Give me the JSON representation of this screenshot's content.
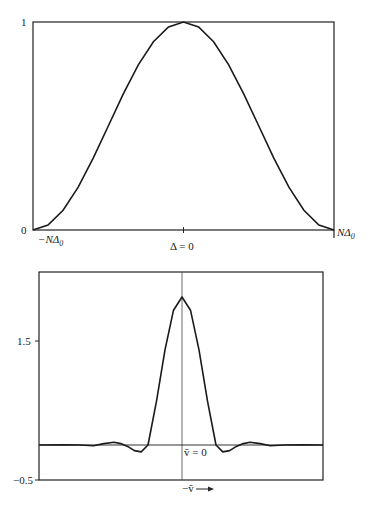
{
  "page": {
    "top_fragment": ""
  },
  "chart_data": [
    {
      "type": "line",
      "title": "",
      "xlabel": "",
      "ylabel": "",
      "x_tick_labels": [
        "−NΔ0",
        "Δ = 0",
        "NΔ0"
      ],
      "y_tick_labels": [
        "0",
        "1"
      ],
      "xlim": [
        -1,
        1
      ],
      "ylim": [
        0,
        1
      ],
      "grid": false,
      "legend": null,
      "x_units": "NΔ0",
      "series": [
        {
          "name": "window",
          "x": [
            -1.0,
            -0.9,
            -0.8,
            -0.7,
            -0.6,
            -0.5,
            -0.4,
            -0.3,
            -0.2,
            -0.1,
            0.0,
            0.1,
            0.2,
            0.3,
            0.4,
            0.5,
            0.6,
            0.7,
            0.8,
            0.9,
            1.0
          ],
          "y": [
            0.0,
            0.024,
            0.095,
            0.206,
            0.345,
            0.5,
            0.655,
            0.794,
            0.905,
            0.976,
            1.0,
            0.976,
            0.905,
            0.794,
            0.655,
            0.5,
            0.345,
            0.206,
            0.095,
            0.024,
            0.0
          ]
        }
      ]
    },
    {
      "type": "line",
      "title": "",
      "xlabel": "−v̄ ⟶",
      "ylabel": "",
      "x_tick_labels": [
        "v̄ = 0"
      ],
      "y_tick_labels": [
        "1.5",
        "−0.5"
      ],
      "y_ticks": [
        1.5,
        -0.5
      ],
      "xlim": [
        -4.2,
        4.15
      ],
      "ylim": [
        -0.5,
        2.49
      ],
      "grid": false,
      "legend": null,
      "reference_lines": {
        "vertical_at_x": 0,
        "horizontal_at_y": 0
      },
      "series": [
        {
          "name": "response",
          "x": [
            -4.2,
            -3.5,
            -3.0,
            -2.6,
            -2.3,
            -2.0,
            -1.8,
            -1.6,
            -1.4,
            -1.2,
            -1.0,
            -0.75,
            -0.5,
            -0.25,
            0.0,
            0.25,
            0.5,
            0.75,
            1.0,
            1.2,
            1.4,
            1.6,
            1.8,
            2.0,
            2.3,
            2.6,
            3.0,
            3.5,
            4.15
          ],
          "y": [
            0.0,
            0.005,
            0.0,
            -0.01,
            0.02,
            0.04,
            0.02,
            -0.02,
            -0.08,
            -0.1,
            0.0,
            0.63,
            1.37,
            1.94,
            2.13,
            1.94,
            1.37,
            0.63,
            0.0,
            -0.1,
            -0.08,
            -0.02,
            0.02,
            0.04,
            0.02,
            -0.01,
            0.0,
            0.005,
            0.0
          ]
        }
      ]
    }
  ],
  "labels": {
    "c1_y1": "1",
    "c1_y0": "0",
    "c1_xleft": "−NΔ",
    "c1_xleft_sub": "0",
    "c1_xmid": "Δ = 0",
    "c1_xright": "NΔ",
    "c1_xright_sub": "0",
    "c2_y15": "1.5",
    "c2_ym05": "−0.5",
    "c2_vbar": "v̄ = 0",
    "c2_xlabel": "−v̄"
  }
}
